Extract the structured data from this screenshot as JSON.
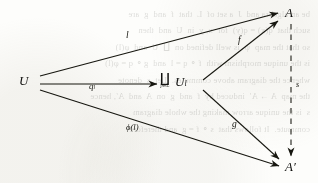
{
  "figure": {
    "kind": "commutative-diagram",
    "background_color": "#fdfdfb",
    "ink_color": "#151510",
    "bleed_through_text": "be an algebra and  J  a set of  L  that  f  and  g  are\nsuch that  q(x) = q(y)  for  x, y  in  U  and  then\nso that the map  ψ  is well defined on  ∐  U  and  φ(l)\nis the unique morphism with  f ∘ q = l  and  g ∘ q = φ(l)\nwhence the diagram above commutes.  Let  s  denote\nthe map  A → A′  induced by  f  and  g  on  A  and  A′, hence\ns  is the unique arrow making the whole diagram\ncommute.  It follows that  s ∘ f = g  and therefore"
  },
  "nodes": [
    {
      "id": "U",
      "label": "U",
      "x": 25,
      "y": 82,
      "font_size": 13
    },
    {
      "id": "coprod",
      "label_symbol": "∐",
      "label_index": "j∈L",
      "label_object": "U",
      "label_subscript": "l",
      "x": 176,
      "y": 84
    },
    {
      "id": "A",
      "label": "A",
      "x": 290,
      "y": 14,
      "font_size": 13
    },
    {
      "id": "Aprime",
      "label": "A′",
      "x": 291,
      "y": 168,
      "font_size": 13
    }
  ],
  "edges": [
    {
      "id": "U-to-A",
      "from": "U",
      "to": "A",
      "label": "l",
      "style": "solid",
      "label_x": 127,
      "label_y": 37
    },
    {
      "id": "U-to-coprod",
      "from": "U",
      "to": "coprod",
      "label": "q",
      "label_sub": "l",
      "style": "solid",
      "label_x": 90,
      "label_y": 87
    },
    {
      "id": "U-to-Aprime",
      "from": "U",
      "to": "Aprime",
      "label": "ϕ(l)",
      "style": "solid",
      "label_x": 126,
      "label_y": 128
    },
    {
      "id": "coprod-to-A",
      "from": "coprod",
      "to": "A",
      "label": "f",
      "style": "solid",
      "label_x": 238,
      "label_y": 42
    },
    {
      "id": "coprod-to-Aprime",
      "from": "coprod",
      "to": "Aprime",
      "label": "g",
      "style": "solid",
      "label_x": 232,
      "label_y": 126
    },
    {
      "id": "A-to-Aprime",
      "from": "A",
      "to": "Aprime",
      "label": "s",
      "style": "dashed",
      "label_x": 296,
      "label_y": 86
    }
  ]
}
